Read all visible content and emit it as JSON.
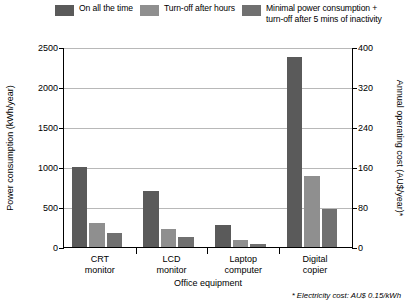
{
  "chart_data": {
    "type": "bar",
    "title": "",
    "categories": [
      "CRT\nmonitor",
      "LCD\nmonitor",
      "Laptop\ncomputer",
      "Digital\ncopier"
    ],
    "series": [
      {
        "name": "On all the time",
        "values": [
          1000,
          700,
          270,
          2380
        ],
        "color": "#5a5a5a"
      },
      {
        "name": "Turn-off after hours",
        "values": [
          300,
          220,
          90,
          890
        ],
        "color": "#8f8f8f"
      },
      {
        "name": "Minimal power consumption +\nturn-off after 5 mins of inactivity",
        "values": [
          180,
          130,
          40,
          470
        ],
        "color": "#707070"
      }
    ],
    "xlabel": "Office equipment",
    "ylabel": "Power consumption (kWh/year)",
    "ylabel_right": "Annual operating cost (AU$/year)*",
    "ylim": [
      0,
      2500
    ],
    "yticks": [
      0,
      500,
      1000,
      1500,
      2000,
      2500
    ],
    "ylim_right": [
      0,
      400
    ],
    "yticks_right": [
      0,
      80,
      160,
      240,
      320,
      400
    ],
    "grid": true,
    "legend_position": "top",
    "footnote": "* Electricity cost: AU$ 0.15/kWh"
  },
  "legend": {
    "items": [
      {
        "label": "On all the time"
      },
      {
        "label": "Turn-off after hours"
      },
      {
        "label": "Minimal power consumption +\nturn-off after 5 mins of inactivity"
      }
    ]
  }
}
